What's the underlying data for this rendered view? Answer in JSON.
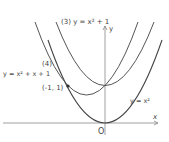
{
  "diagram": {
    "title_label": "(3) y = x² + 1",
    "curve4_number": "(4)",
    "curve4_equation": "y = x² + x + 1",
    "point_label": "(-1, 1)",
    "base_curve_label": "y = x²",
    "x_axis_label": "x",
    "y_axis_label": "y",
    "origin_label": "O",
    "colors": {
      "curve": "#444444",
      "axis": "#777777",
      "text": "#444444"
    }
  }
}
